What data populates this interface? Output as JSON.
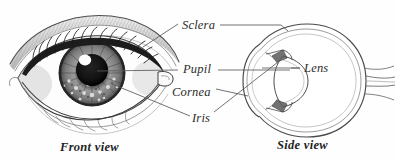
{
  "figure": {
    "background_color": "#fefefe",
    "ink_color": "#2b2b2b",
    "width": 395,
    "height": 161
  },
  "labels": [
    {
      "id": "sclera",
      "text": "Sclera",
      "style": "italic"
    },
    {
      "id": "pupil",
      "text": "Pupil",
      "style": "italic"
    },
    {
      "id": "cornea",
      "text": "Cornea",
      "style": "italic"
    },
    {
      "id": "iris",
      "text": "Iris",
      "style": "italic"
    },
    {
      "id": "lens",
      "text": "Lens",
      "style": "italic"
    }
  ],
  "captions": [
    {
      "id": "front-view",
      "text": "Front view",
      "style": "bold-italic"
    },
    {
      "id": "side-view",
      "text": "Side view",
      "style": "bold-italic"
    }
  ],
  "diagram_parts": {
    "front_view": [
      "eyebrow-shading",
      "upper-eyelid",
      "lower-eyelid",
      "eyelashes",
      "sclera-white",
      "iris-textured",
      "pupil-dark",
      "specular-highlight",
      "tear-duct"
    ],
    "side_view": [
      "sclera-outer-wall",
      "cornea-bulge",
      "anterior-chamber",
      "iris-flap",
      "lens-oval",
      "ciliary-body",
      "vitreous-body",
      "retina-layer",
      "optic-nerve"
    ]
  }
}
